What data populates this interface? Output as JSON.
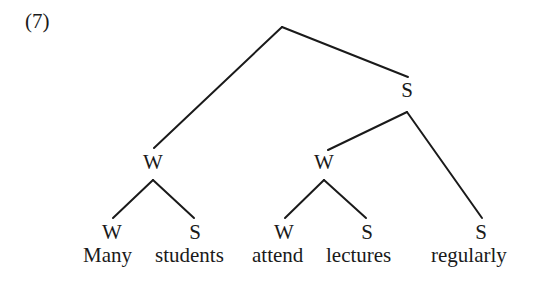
{
  "example_number": "(7)",
  "tree": {
    "root": {
      "label": ""
    },
    "nodes": [
      {
        "id": "s-top",
        "label": "S"
      },
      {
        "id": "w-left",
        "label": "W"
      },
      {
        "id": "w-mid",
        "label": "W"
      },
      {
        "id": "w-many",
        "label": "W"
      },
      {
        "id": "s-students",
        "label": "S"
      },
      {
        "id": "w-attend",
        "label": "W"
      },
      {
        "id": "s-lectures",
        "label": "S"
      },
      {
        "id": "s-regularly",
        "label": "S"
      }
    ],
    "words": [
      "Many",
      "students",
      "attend",
      "lectures",
      "regularly"
    ],
    "edges": [
      [
        "root",
        "w-left"
      ],
      [
        "root",
        "s-top"
      ],
      [
        "w-left",
        "w-many"
      ],
      [
        "w-left",
        "s-students"
      ],
      [
        "s-top",
        "w-mid"
      ],
      [
        "s-top",
        "s-regularly"
      ],
      [
        "w-mid",
        "w-attend"
      ],
      [
        "w-mid",
        "s-lectures"
      ]
    ]
  }
}
